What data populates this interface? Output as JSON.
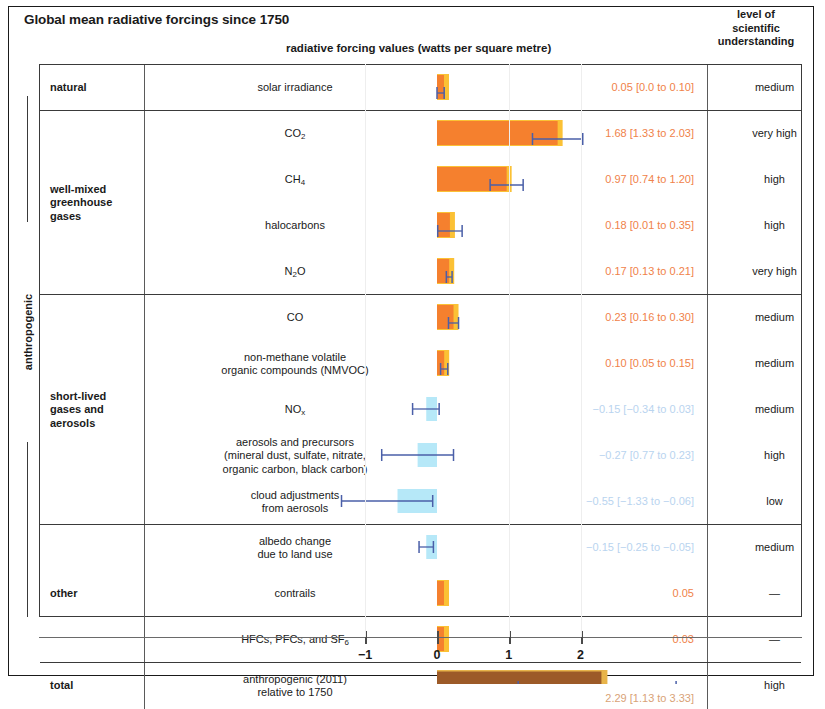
{
  "header": {
    "title": "Global mean radiative forcings since 1750",
    "subtitle": "radiative forcing values (watts per square metre)",
    "losu_header": "level of\nscientific\nunderstanding"
  },
  "side_label": "anthropogenic",
  "axis": {
    "ticks": [
      -1,
      0,
      1,
      2
    ],
    "tick_labels": [
      "−1",
      "0",
      "1",
      "2"
    ],
    "min": -1.5,
    "max": 2.75,
    "px_per_unit": 71.8,
    "zero_px": 437
  },
  "colors": {
    "positive_bar": "#f5802e",
    "positive_bar_edge": "#fbc135",
    "negative_bar": "#a9e4f7",
    "total_bar": "#9c5a28",
    "total_bar_edge": "#e8b44a",
    "error_bar": "#4a5fa8",
    "positive_text": "#f0824a",
    "negative_text": "#b9d4ef",
    "total_text": "#d9a277",
    "frame": "#1a1a1a"
  },
  "groups": [
    {
      "name": "natural",
      "rows": [
        {
          "label": "solar irradiance",
          "value": 0.05,
          "low": 0.0,
          "high": 0.1,
          "value_text": "0.05 [0.0 to 0.10]",
          "losu": "medium",
          "sign": "pos",
          "has_error_bar": true
        }
      ]
    },
    {
      "name": "well-mixed\ngreenhouse\ngases",
      "rows": [
        {
          "label": "CO2",
          "label_html": "CO<sub>2</sub>",
          "value": 1.68,
          "low": 1.33,
          "high": 2.03,
          "value_text": "1.68 [1.33 to 2.03]",
          "losu": "very high",
          "sign": "pos",
          "has_error_bar": true
        },
        {
          "label": "CH4",
          "label_html": "CH<sub>4</sub>",
          "value": 0.97,
          "low": 0.74,
          "high": 1.2,
          "value_text": "0.97 [0.74 to 1.20]",
          "losu": "high",
          "sign": "pos",
          "has_error_bar": true
        },
        {
          "label": "halocarbons",
          "label_html": "halocarbons",
          "value": 0.18,
          "low": 0.01,
          "high": 0.35,
          "value_text": "0.18 [0.01 to 0.35]",
          "losu": "high",
          "sign": "pos",
          "has_error_bar": true
        },
        {
          "label": "N2O",
          "label_html": "N<sub>2</sub>O",
          "value": 0.17,
          "low": 0.13,
          "high": 0.21,
          "value_text": "0.17 [0.13 to 0.21]",
          "losu": "very high",
          "sign": "pos",
          "has_error_bar": true
        }
      ]
    },
    {
      "name": "short-lived\ngases and\naerosols",
      "rows": [
        {
          "label": "CO",
          "label_html": "CO",
          "value": 0.23,
          "low": 0.16,
          "high": 0.3,
          "value_text": "0.23 [0.16 to 0.30]",
          "losu": "medium",
          "sign": "pos",
          "has_error_bar": true
        },
        {
          "label": "non-methane volatile organic compounds (NMVOC)",
          "label_html": "non-methane volatile<br>organic compounds (NMVOC)",
          "value": 0.1,
          "low": 0.05,
          "high": 0.15,
          "value_text": "0.10 [0.05 to 0.15]",
          "losu": "medium",
          "sign": "pos",
          "has_error_bar": true
        },
        {
          "label": "NOx",
          "label_html": "NO<sub>x</sub>",
          "value": -0.15,
          "low": -0.34,
          "high": 0.03,
          "value_text": "−0.15 [−0.34 to 0.03]",
          "losu": "medium",
          "sign": "neg",
          "has_error_bar": true
        },
        {
          "label": "aerosols and precursors (mineral dust, sulfate, nitrate, organic carbon, black carbon)",
          "label_html": "aerosols and precursors<br>(mineral dust, sulfate, nitrate,<br>organic carbon, black carbon)",
          "value": -0.27,
          "low": -0.77,
          "high": 0.23,
          "value_text": "−0.27 [0.77 to 0.23]",
          "losu": "high",
          "sign": "neg",
          "has_error_bar": true
        },
        {
          "label": "cloud adjustments from aerosols",
          "label_html": "cloud adjustments<br>from aerosols",
          "value": -0.55,
          "low": -1.33,
          "high": -0.06,
          "value_text": "−0.55 [−1.33 to −0.06]",
          "losu": "low",
          "sign": "neg",
          "has_error_bar": true
        }
      ]
    },
    {
      "name": "other",
      "rows": [
        {
          "label": "albedo change due to land use",
          "label_html": "albedo change<br>due to land use",
          "value": -0.15,
          "low": -0.25,
          "high": -0.05,
          "value_text": "−0.15 [−0.25 to −0.05]",
          "losu": "medium",
          "sign": "neg",
          "has_error_bar": true
        },
        {
          "label": "contrails",
          "label_html": "contrails",
          "value": 0.05,
          "low": null,
          "high": null,
          "value_text": "0.05",
          "losu": "—",
          "sign": "pos",
          "has_error_bar": false
        },
        {
          "label": "HFCs, PFCs, and SF6",
          "label_html": "HFCs, PFCs, and SF<sub>6</sub>",
          "value": 0.03,
          "low": null,
          "high": null,
          "value_text": "0.03",
          "losu": "—",
          "sign": "pos",
          "has_error_bar": false
        }
      ]
    },
    {
      "name": "total",
      "rows": [
        {
          "label": "anthropogenic (2011) relative to 1750",
          "label_html": "anthropogenic (2011)<br>relative to 1750",
          "value": 2.29,
          "low": 1.13,
          "high": 3.33,
          "value_text": "2.29 [1.13 to 3.33]",
          "losu": "high",
          "sign": "tot",
          "has_error_bar": true
        }
      ]
    }
  ],
  "chart_data": {
    "type": "bar",
    "title": "Global mean radiative forcings since 1750",
    "xlabel": "radiative forcing values (watts per square metre)",
    "ylabel": "",
    "orientation": "horizontal",
    "xlim": [
      -1.5,
      2.75
    ],
    "xticks": [
      -1,
      0,
      1,
      2
    ],
    "grid": false,
    "categories": [
      "solar irradiance",
      "CO2",
      "CH4",
      "halocarbons",
      "N2O",
      "CO",
      "non-methane volatile organic compounds (NMVOC)",
      "NOx",
      "aerosols and precursors (mineral dust, sulfate, nitrate, organic carbon, black carbon)",
      "cloud adjustments from aerosols",
      "albedo change due to land use",
      "contrails",
      "HFCs, PFCs, and SF6",
      "anthropogenic (2011) relative to 1750"
    ],
    "values": [
      0.05,
      1.68,
      0.97,
      0.18,
      0.17,
      0.23,
      0.1,
      -0.15,
      -0.27,
      -0.55,
      -0.15,
      0.05,
      0.03,
      2.29
    ],
    "error_low": [
      0.0,
      1.33,
      0.74,
      0.01,
      0.13,
      0.16,
      0.05,
      -0.34,
      -0.77,
      -1.33,
      -0.25,
      null,
      null,
      1.13
    ],
    "error_high": [
      0.1,
      2.03,
      1.2,
      0.35,
      0.21,
      0.3,
      0.15,
      0.03,
      0.23,
      -0.06,
      -0.05,
      null,
      null,
      3.33
    ],
    "group_of": [
      "natural",
      "well-mixed greenhouse gases",
      "well-mixed greenhouse gases",
      "well-mixed greenhouse gases",
      "well-mixed greenhouse gases",
      "short-lived gases and aerosols",
      "short-lived gases and aerosols",
      "short-lived gases and aerosols",
      "short-lived gases and aerosols",
      "short-lived gases and aerosols",
      "other",
      "other",
      "other",
      "total"
    ],
    "level_of_scientific_understanding": [
      "medium",
      "very high",
      "high",
      "high",
      "very high",
      "medium",
      "medium",
      "medium",
      "high",
      "low",
      "medium",
      "—",
      "—",
      "high"
    ]
  }
}
